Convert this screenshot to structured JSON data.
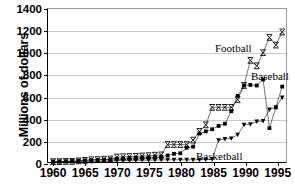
{
  "chart_data": {
    "type": "line",
    "title": "",
    "xlabel": "",
    "ylabel": "Millions of dollars",
    "xlim": [
      1959.2,
      1996.6
    ],
    "ylim": [
      0,
      1400
    ],
    "ytick_values": [
      0,
      200,
      400,
      600,
      800,
      1000,
      1200,
      1400
    ],
    "ytick_labels": [
      "0",
      "200",
      "400",
      "600",
      "800",
      "1000",
      "1200",
      "1400"
    ],
    "xtick_values": [
      1960,
      1965,
      1970,
      1975,
      1980,
      1985,
      1990,
      1995
    ],
    "xtick_labels": [
      "1960",
      "1965",
      "1970",
      "1975",
      "1980",
      "1985",
      "1990",
      "1995"
    ],
    "grid": "horizontal",
    "legend_position": "inline-annotations",
    "series": [
      {
        "name": "Football",
        "marker": "x-cross",
        "color": "#000000",
        "x": [
          1960,
          1961,
          1962,
          1963,
          1964,
          1965,
          1966,
          1967,
          1968,
          1969,
          1970,
          1971,
          1972,
          1973,
          1974,
          1975,
          1976,
          1977,
          1978,
          1979,
          1980,
          1981,
          1982,
          1983,
          1984,
          1985,
          1986,
          1987,
          1988,
          1989,
          1990,
          1991,
          1992,
          1993,
          1994,
          1995,
          1996
        ],
        "values": [
          3,
          3,
          5,
          5,
          10,
          15,
          20,
          22,
          25,
          28,
          45,
          48,
          50,
          52,
          55,
          58,
          62,
          65,
          160,
          160,
          160,
          160,
          200,
          280,
          340,
          500,
          500,
          500,
          500,
          570,
          700,
          930,
          880,
          1000,
          1140,
          1070,
          1190
        ]
      },
      {
        "name": "Baseball",
        "marker": "filled-square",
        "color": "#000000",
        "x": [
          1960,
          1961,
          1962,
          1963,
          1964,
          1965,
          1966,
          1967,
          1968,
          1969,
          1970,
          1971,
          1972,
          1973,
          1974,
          1975,
          1976,
          1977,
          1978,
          1979,
          1980,
          1981,
          1982,
          1983,
          1984,
          1985,
          1986,
          1987,
          1988,
          1989,
          1990,
          1991,
          1992,
          1993,
          1994,
          1995,
          1996
        ],
        "values": [
          3,
          4,
          6,
          8,
          12,
          15,
          18,
          20,
          22,
          25,
          30,
          32,
          35,
          38,
          40,
          42,
          45,
          48,
          60,
          75,
          80,
          130,
          140,
          260,
          280,
          300,
          330,
          350,
          465,
          605,
          700,
          705,
          700,
          755,
          310,
          500,
          690
        ]
      },
      {
        "name": "Basketball",
        "marker": "triangle",
        "color": "#000000",
        "x": [
          1960,
          1961,
          1962,
          1963,
          1964,
          1965,
          1966,
          1967,
          1968,
          1969,
          1970,
          1971,
          1972,
          1973,
          1974,
          1975,
          1976,
          1977,
          1978,
          1979,
          1980,
          1981,
          1982,
          1983,
          1984,
          1985,
          1986,
          1987,
          1988,
          1989,
          1990,
          1991,
          1992,
          1993,
          1994,
          1995,
          1996
        ],
        "values": [
          2,
          2,
          3,
          4,
          5,
          6,
          7,
          8,
          9,
          10,
          12,
          13,
          14,
          15,
          16,
          17,
          18,
          19,
          20,
          20,
          20,
          20,
          20,
          20,
          22,
          25,
          200,
          210,
          215,
          250,
          340,
          345,
          370,
          375,
          480,
          500,
          590
        ]
      }
    ],
    "annotations": [
      {
        "name": "Football",
        "text": "Football"
      },
      {
        "name": "Baseball",
        "text": "Baseball"
      },
      {
        "name": "Basketball",
        "text": "Basketball"
      }
    ]
  }
}
